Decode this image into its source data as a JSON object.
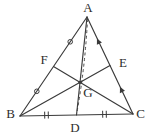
{
  "figure": {
    "width": 147,
    "height": 137,
    "background": "#ffffff",
    "stroke_color": "#3a3a3a",
    "label_color": "#2e2e2e",
    "label_size": 13,
    "line_width": 1.15,
    "points": {
      "A": [
        87,
        17
      ],
      "B": [
        20,
        116
      ],
      "C": [
        133,
        114
      ],
      "D": [
        76.5,
        115
      ],
      "E": [
        110,
        65.5
      ],
      "F": [
        53.5,
        66.5
      ],
      "G": [
        80,
        82.3
      ]
    },
    "edges": [
      [
        "A",
        "B"
      ],
      [
        "B",
        "C"
      ],
      [
        "C",
        "A"
      ]
    ],
    "medians": [
      [
        "A",
        "D"
      ],
      [
        "B",
        "E"
      ],
      [
        "C",
        "F"
      ]
    ],
    "dashed": {
      "path": "M 87.5,19 Q 85.3,66 76.8,113",
      "dash": "3 2.6",
      "width": 0.9
    },
    "marks": {
      "circle_r": 2.3,
      "circles": [
        [
          70.2,
          41.8
        ],
        [
          36.8,
          91.3
        ]
      ],
      "arrow_points": "-3.4,0 2.4,-2.8 2.4,2.8",
      "arrows": [
        [
          98.4,
          41.5,
          64.6
        ],
        [
          121.4,
          89.8,
          64.6
        ]
      ],
      "tick_len": 7,
      "tick_gap": 3.6,
      "double_ticks": [
        [
          46.5,
          115.1,
          -1
        ],
        [
          104.5,
          114.3,
          -1
        ]
      ]
    },
    "centroid_dot_r": 1.6,
    "labels": [
      {
        "text": "A",
        "x": 88,
        "y": 7.5
      },
      {
        "text": "B",
        "x": 10.5,
        "y": 113
      },
      {
        "text": "C",
        "x": 140.5,
        "y": 113.5
      },
      {
        "text": "D",
        "x": 75,
        "y": 127.5
      },
      {
        "text": "E",
        "x": 123,
        "y": 62.5
      },
      {
        "text": "F",
        "x": 44,
        "y": 59
      },
      {
        "text": "G",
        "x": 88,
        "y": 92
      }
    ]
  }
}
